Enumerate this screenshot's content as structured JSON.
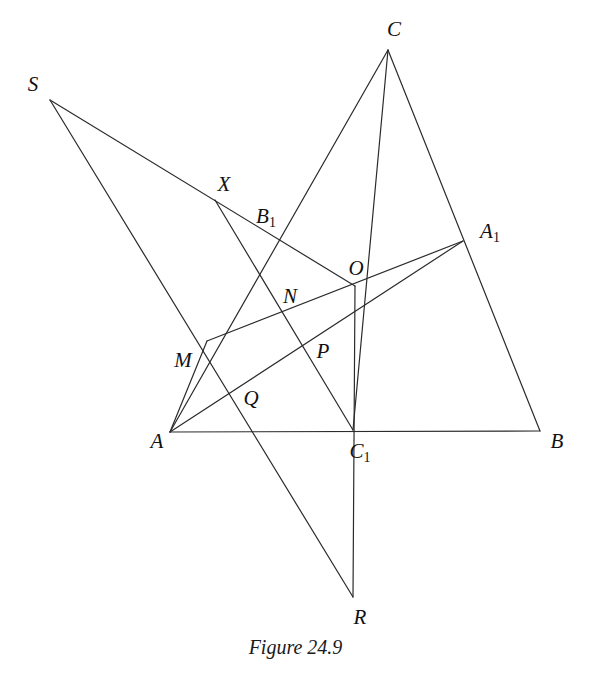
{
  "figure": {
    "caption": "Figure 24.9",
    "caption_x": 295,
    "caption_y": 636,
    "background_color": "#ffffff",
    "stroke_color": "#2b2b2b",
    "stroke_width": 1.2,
    "width": 591,
    "height": 677
  },
  "points": [
    {
      "id": "S",
      "label": "S",
      "sub": "",
      "x": 50,
      "y": 100,
      "label_x": 33,
      "label_y": 84
    },
    {
      "id": "C",
      "label": "C",
      "sub": "",
      "x": 388,
      "y": 50,
      "label_x": 394,
      "label_y": 29
    },
    {
      "id": "X",
      "label": "X",
      "sub": "",
      "x": 215,
      "y": 200,
      "label_x": 224,
      "label_y": 184
    },
    {
      "id": "B1",
      "label": "B",
      "sub": "1",
      "x": 280,
      "y": 240,
      "label_x": 266,
      "label_y": 218
    },
    {
      "id": "A1",
      "label": "A",
      "sub": "1",
      "x": 463,
      "y": 241,
      "label_x": 490,
      "label_y": 233
    },
    {
      "id": "O",
      "label": "O",
      "sub": "",
      "x": 355,
      "y": 286,
      "label_x": 356,
      "label_y": 268
    },
    {
      "id": "N",
      "label": "N",
      "sub": "",
      "x": 283,
      "y": 314,
      "label_x": 290,
      "label_y": 296
    },
    {
      "id": "M",
      "label": "M",
      "sub": "",
      "x": 207,
      "y": 341,
      "label_x": 183,
      "label_y": 360
    },
    {
      "id": "P",
      "label": "P",
      "sub": "",
      "x": 310,
      "y": 349,
      "label_x": 323,
      "label_y": 351
    },
    {
      "id": "Q",
      "label": "Q",
      "sub": "",
      "x": 232,
      "y": 392,
      "label_x": 251,
      "label_y": 398
    },
    {
      "id": "A",
      "label": "A",
      "sub": "",
      "x": 170,
      "y": 432,
      "label_x": 157,
      "label_y": 441
    },
    {
      "id": "C1",
      "label": "C",
      "sub": "1",
      "x": 353,
      "y": 430,
      "label_x": 360,
      "label_y": 453
    },
    {
      "id": "B",
      "label": "B",
      "sub": "",
      "x": 540,
      "y": 431,
      "label_x": 557,
      "label_y": 441
    },
    {
      "id": "R",
      "label": "R",
      "sub": "",
      "x": 353,
      "y": 597,
      "label_x": 360,
      "label_y": 617
    }
  ],
  "segments": [
    {
      "name": "side-AB",
      "from": "A",
      "to": "B"
    },
    {
      "name": "side-AC",
      "from": "A",
      "to": "C"
    },
    {
      "name": "side-CB",
      "from": "C",
      "to": "B"
    },
    {
      "name": "cevian-A-A1",
      "from": "A",
      "to": "A1"
    },
    {
      "name": "cevian-C-C1",
      "from": "C",
      "to": "C1"
    },
    {
      "name": "line-M-A1",
      "from": "M",
      "to": "A1"
    },
    {
      "name": "line-O-C1-R",
      "from": "O",
      "to": "R"
    },
    {
      "name": "line-S-X-O",
      "from": "S",
      "to": "O"
    },
    {
      "name": "line-S-R",
      "from": "S",
      "to": "R"
    },
    {
      "name": "line-X-C1",
      "from": "X",
      "to": "C1"
    },
    {
      "name": "line-A-M",
      "from": "A",
      "to": "M"
    }
  ],
  "chart_data": {
    "type": "diagram",
    "title": "Figure 24.9"
  }
}
